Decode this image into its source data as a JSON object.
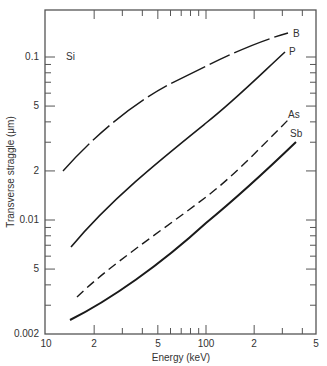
{
  "chart_data": {
    "type": "line",
    "title": "",
    "xlabel": "Energy (keV)",
    "ylabel": "Transverse straggle (μm)",
    "xscale": "log",
    "yscale": "log",
    "xlim": [
      10,
      500
    ],
    "ylim": [
      0.002,
      0.194
    ],
    "grid": false,
    "legend": "inline labels at curve ends",
    "annotation": "Si",
    "x_tick_labels": [
      {
        "value": 10,
        "label": "10"
      },
      {
        "value": 20,
        "label": "2"
      },
      {
        "value": 50,
        "label": "5"
      },
      {
        "value": 100,
        "label": "100"
      },
      {
        "value": 200,
        "label": "2"
      },
      {
        "value": 500,
        "label": "5"
      }
    ],
    "y_tick_labels": [
      {
        "value": 0.002,
        "label": "0.002"
      },
      {
        "value": 0.005,
        "label": "5"
      },
      {
        "value": 0.01,
        "label": "0.01"
      },
      {
        "value": 0.02,
        "label": "2"
      },
      {
        "value": 0.05,
        "label": "5"
      },
      {
        "value": 0.1,
        "label": "0.1"
      }
    ],
    "series": [
      {
        "name": "B",
        "style": "long-dash",
        "x": [
          12.8,
          20,
          50,
          100,
          200,
          325
        ],
        "values": [
          0.02,
          0.028,
          0.052,
          0.085,
          0.12,
          0.141
        ]
      },
      {
        "name": "P",
        "style": "solid",
        "x": [
          14.3,
          20,
          50,
          100,
          200,
          312
        ],
        "values": [
          0.0068,
          0.0088,
          0.019,
          0.039,
          0.073,
          0.107
        ]
      },
      {
        "name": "As",
        "style": "dashed",
        "x": [
          15.6,
          20,
          50,
          100,
          200,
          325
        ],
        "values": [
          0.0034,
          0.0039,
          0.0071,
          0.0138,
          0.026,
          0.041
        ]
      },
      {
        "name": "Sb",
        "style": "solid",
        "x": [
          14.1,
          20,
          50,
          100,
          200,
          364
        ],
        "values": [
          0.0024,
          0.0029,
          0.0051,
          0.0096,
          0.0175,
          0.03
        ]
      }
    ]
  },
  "labels": {
    "x_axis": "Energy (keV)",
    "y_axis": "Transverse straggle (μm)",
    "substrate": "Si",
    "series_B": "B",
    "series_P": "P",
    "series_As": "As",
    "series_Sb": "Sb",
    "x_ticks": [
      "10",
      "2",
      "5",
      "100",
      "2",
      "5"
    ],
    "y_ticks": [
      "0.002",
      "5",
      "0.01",
      "2",
      "5",
      "0.1"
    ]
  },
  "colors": {
    "axis": "#555555",
    "curve": "#1a1a1a"
  }
}
